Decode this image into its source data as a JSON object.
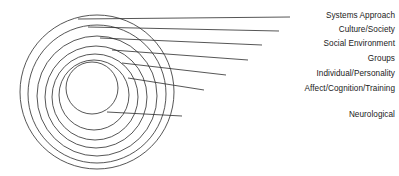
{
  "diagram": {
    "type": "concentric-rings",
    "background_color": "#ffffff",
    "stroke_color": "#2b2b2b",
    "text_color": "#1a1a1a",
    "ring_count": 7,
    "levels": [
      {
        "index": 0,
        "label": "Systems Approach",
        "scope": "outermost",
        "label_y": 17,
        "leader_start_x": 78,
        "leader_start_y": 19,
        "leader_end_x": 290,
        "leader_end_y": 17,
        "circle": {
          "cx": 97,
          "cy": 92,
          "r": 77
        }
      },
      {
        "index": 1,
        "label": "Culture/Society",
        "scope": "ring-2",
        "label_y": 31,
        "leader_start_x": 88,
        "leader_start_y": 27,
        "leader_end_x": 279,
        "leader_end_y": 31,
        "circle": {
          "cx": 97,
          "cy": 94,
          "r": 69
        }
      },
      {
        "index": 2,
        "label": "Social Environment",
        "scope": "ring-3",
        "label_y": 45,
        "leader_start_x": 100,
        "leader_start_y": 38,
        "leader_end_x": 262,
        "leader_end_y": 45,
        "circle": {
          "cx": 97,
          "cy": 96,
          "r": 60
        }
      },
      {
        "index": 3,
        "label": "Groups",
        "scope": "ring-4",
        "label_y": 60,
        "leader_start_x": 112,
        "leader_start_y": 50,
        "leader_end_x": 248,
        "leader_end_y": 60,
        "circle": {
          "cx": 96,
          "cy": 97,
          "r": 51
        }
      },
      {
        "index": 4,
        "label": "Individual/Personality",
        "scope": "ring-5",
        "label_y": 75,
        "leader_start_x": 122,
        "leader_start_y": 63,
        "leader_end_x": 226,
        "leader_end_y": 75,
        "circle": {
          "cx": 95,
          "cy": 97,
          "r": 43
        }
      },
      {
        "index": 5,
        "label": "Affect/Cognition/Training",
        "scope": "ring-6",
        "label_y": 90,
        "leader_start_x": 128,
        "leader_start_y": 78,
        "leader_end_x": 204,
        "leader_end_y": 90,
        "circle": {
          "cx": 94,
          "cy": 95,
          "r": 35
        }
      },
      {
        "index": 6,
        "label": "Neurological",
        "scope": "innermost",
        "label_y": 116,
        "leader_start_x": 107,
        "leader_start_y": 112,
        "leader_end_x": 182,
        "leader_end_y": 116,
        "circle": {
          "cx": 92,
          "cy": 88,
          "r": 26
        }
      }
    ]
  }
}
